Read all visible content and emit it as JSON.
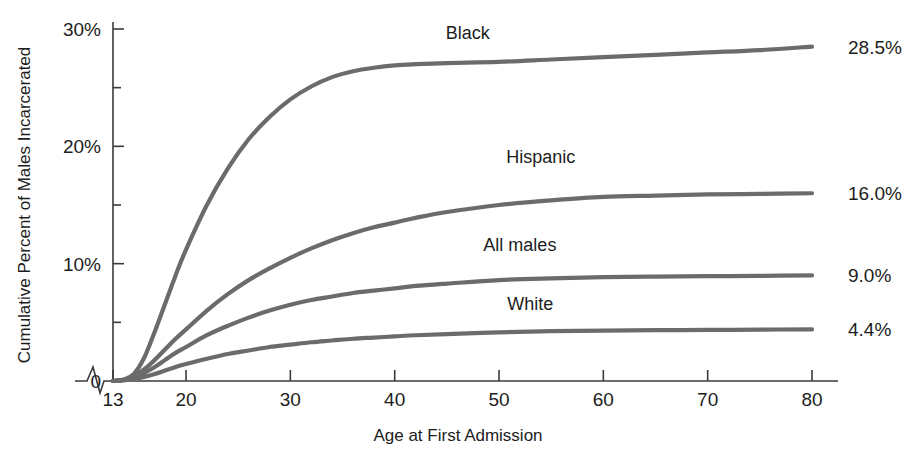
{
  "chart_data": {
    "type": "line",
    "title": "",
    "xlabel": "Age at First Admission",
    "ylabel": "Cumulative Percent of Males Incarcerated",
    "xlim": [
      13,
      80
    ],
    "ylim": [
      0,
      30
    ],
    "grid": false,
    "legend_position": "inline-right",
    "axis_break": true,
    "x_tick_labels": [
      "13",
      "20",
      "30",
      "40",
      "50",
      "60",
      "70",
      "80"
    ],
    "x_ticks": [
      13,
      20,
      30,
      40,
      50,
      60,
      70,
      80
    ],
    "y_tick_labels": [
      "0",
      "10%",
      "20%",
      "30%"
    ],
    "y_ticks": [
      0,
      10,
      20,
      30
    ],
    "y_minor_ticks": [
      5,
      15,
      25
    ],
    "line_color": "#6b6b6b",
    "x": [
      13,
      14,
      15,
      16,
      17,
      18,
      19,
      20,
      22,
      24,
      26,
      28,
      30,
      32,
      34,
      36,
      38,
      40,
      42,
      45,
      50,
      55,
      60,
      65,
      70,
      75,
      80
    ],
    "series": [
      {
        "name": "Black",
        "label": "Black",
        "end_label": "28.5%",
        "final_value": 28.5,
        "values": [
          0.0,
          0.1,
          0.6,
          2.0,
          4.2,
          6.6,
          9.0,
          11.2,
          15.0,
          18.1,
          20.6,
          22.5,
          24.0,
          25.1,
          25.9,
          26.4,
          26.7,
          26.9,
          27.0,
          27.1,
          27.2,
          27.4,
          27.6,
          27.8,
          28.0,
          28.2,
          28.5
        ]
      },
      {
        "name": "Hispanic",
        "label": "Hispanic",
        "end_label": "16.0%",
        "final_value": 16.0,
        "values": [
          0.0,
          0.1,
          0.4,
          1.0,
          1.8,
          2.7,
          3.6,
          4.4,
          6.0,
          7.4,
          8.6,
          9.6,
          10.5,
          11.3,
          12.0,
          12.6,
          13.1,
          13.5,
          13.9,
          14.4,
          15.0,
          15.4,
          15.7,
          15.8,
          15.9,
          15.95,
          16.0
        ]
      },
      {
        "name": "All males",
        "label": "All males",
        "end_label": "9.0%",
        "final_value": 9.0,
        "values": [
          0.0,
          0.1,
          0.3,
          0.7,
          1.2,
          1.8,
          2.4,
          2.9,
          3.9,
          4.7,
          5.4,
          6.0,
          6.5,
          6.9,
          7.2,
          7.5,
          7.7,
          7.9,
          8.1,
          8.3,
          8.6,
          8.75,
          8.85,
          8.9,
          8.93,
          8.96,
          9.0
        ]
      },
      {
        "name": "White",
        "label": "White",
        "end_label": "4.4%",
        "final_value": 4.4,
        "values": [
          0.0,
          0.05,
          0.15,
          0.35,
          0.6,
          0.9,
          1.2,
          1.45,
          1.9,
          2.3,
          2.6,
          2.9,
          3.1,
          3.3,
          3.45,
          3.6,
          3.7,
          3.8,
          3.9,
          4.0,
          4.15,
          4.25,
          4.3,
          4.33,
          4.35,
          4.38,
          4.4
        ]
      }
    ],
    "series_label_positions": [
      {
        "name": "Black",
        "x": 47,
        "y": 29.7
      },
      {
        "name": "Hispanic",
        "x": 54,
        "y": 19.1
      },
      {
        "name": "All males",
        "x": 52,
        "y": 11.6
      },
      {
        "name": "White",
        "x": 53,
        "y": 6.6
      }
    ]
  }
}
